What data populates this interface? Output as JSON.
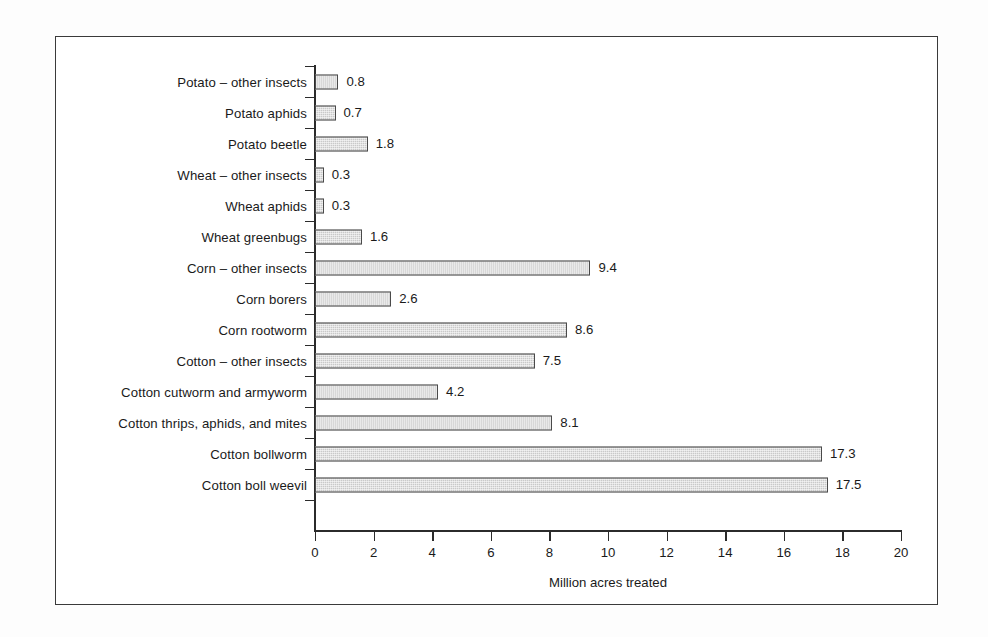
{
  "figure": {
    "background_color": "#fdfdfd",
    "frame_color": "#3a3a3a",
    "bar_fill_color": "#c9c9c9",
    "bar_border_color": "#4a4a4a",
    "axis_color": "#2b2b2b"
  },
  "chart_data": {
    "type": "bar",
    "orientation": "horizontal",
    "title": "",
    "xlabel": "Million acres treated",
    "ylabel": "",
    "xlim": [
      0,
      20
    ],
    "xticks": [
      0,
      2,
      4,
      6,
      8,
      10,
      12,
      14,
      16,
      18,
      20
    ],
    "xtick_labels": [
      "0",
      "2",
      "4",
      "6",
      "8",
      "10",
      "12",
      "14",
      "16",
      "18",
      "20"
    ],
    "grid": false,
    "legend": false,
    "value_labels": true,
    "categories": [
      "Potato – other insects",
      "Potato aphids",
      "Potato beetle",
      "Wheat – other insects",
      "Wheat aphids",
      "Wheat greenbugs",
      "Corn – other insects",
      "Corn borers",
      "Corn rootworm",
      "Cotton – other insects",
      "Cotton cutworm and armyworm",
      "Cotton thrips, aphids, and mites",
      "Cotton bollworm",
      "Cotton boll weevil"
    ],
    "values": [
      0.8,
      0.7,
      1.8,
      0.3,
      0.3,
      1.6,
      9.4,
      2.6,
      8.6,
      7.5,
      4.2,
      8.1,
      17.3,
      17.5
    ],
    "value_label_texts": [
      "0.8",
      "0.7",
      "1.8",
      "0.3",
      "0.3",
      "1.6",
      "9.4",
      "2.6",
      "8.6",
      "7.5",
      "4.2",
      "8.1",
      "17.3",
      "17.5"
    ]
  }
}
